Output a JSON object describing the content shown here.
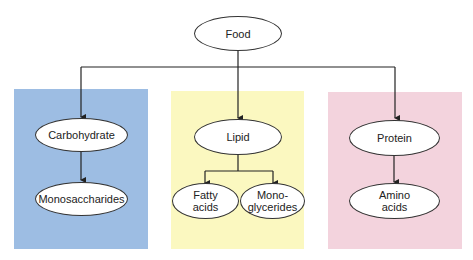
{
  "diagram": {
    "root": {
      "label": "Food"
    },
    "groups": [
      {
        "id": "carbohydrate",
        "color": "#9dbde3",
        "node": "Carbohydrate",
        "children": [
          "Monosaccharides"
        ]
      },
      {
        "id": "lipid",
        "color": "#fbf8c0",
        "node": "Lipid",
        "children": [
          "Fatty acids",
          "Mono-glycerides"
        ]
      },
      {
        "id": "protein",
        "color": "#f3d3dd",
        "node": "Protein",
        "children": [
          "Amino acids"
        ]
      }
    ],
    "labels": {
      "food": "Food",
      "carbohydrate": "Carbohydrate",
      "monosaccharides": "Monosaccharides",
      "lipid": "Lipid",
      "fatty_line1": "Fatty",
      "fatty_line2": "acids",
      "mono_line1": "Mono-",
      "mono_line2": "glycerides",
      "protein": "Protein",
      "amino_line1": "Amino",
      "amino_line2": "acids"
    }
  }
}
